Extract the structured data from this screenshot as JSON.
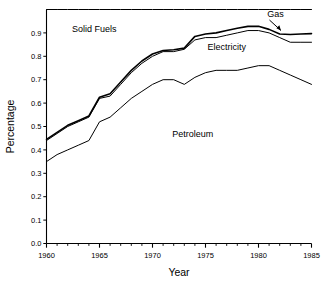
{
  "chart_data": {
    "type": "line",
    "title": "",
    "subtitle": "",
    "xlabel": "Year",
    "ylabel": "Percentage",
    "xlim": [
      1960,
      1985
    ],
    "ylim": [
      0.0,
      1.0
    ],
    "grid": false,
    "legend_position": "inline-annotations",
    "x_ticks_major": [
      1960,
      1965,
      1970,
      1975,
      1980,
      1985
    ],
    "x_tick_labels": [
      "1960",
      "1965",
      "1970",
      "1975",
      "1980",
      "1985"
    ],
    "x_ticks_minor_step": 1,
    "y_ticks": [
      0.0,
      0.1,
      0.2,
      0.3,
      0.4,
      0.5,
      0.6,
      0.7,
      0.8,
      0.9
    ],
    "y_tick_labels": [
      "0.0",
      "0.1",
      "0.2",
      "0.3",
      "0.4",
      "0.5",
      "0.6",
      "0.7",
      "0.8",
      "0.9"
    ],
    "x": [
      1960,
      1961,
      1962,
      1963,
      1964,
      1965,
      1966,
      1967,
      1968,
      1969,
      1970,
      1971,
      1972,
      1973,
      1974,
      1975,
      1976,
      1977,
      1978,
      1979,
      1980,
      1981,
      1982,
      1983,
      1984,
      1985
    ],
    "series": [
      {
        "name": "Petroleum",
        "label": "Petroleum",
        "color": "#000000",
        "line_width": 1,
        "values": [
          0.35,
          0.38,
          0.4,
          0.42,
          0.44,
          0.52,
          0.54,
          0.58,
          0.62,
          0.65,
          0.68,
          0.7,
          0.7,
          0.68,
          0.71,
          0.73,
          0.74,
          0.74,
          0.74,
          0.75,
          0.76,
          0.76,
          0.74,
          0.72,
          0.7,
          0.68
        ]
      },
      {
        "name": "Electricity",
        "label": "Electricity",
        "color": "#000000",
        "line_width": 1,
        "values": [
          0.44,
          0.47,
          0.5,
          0.52,
          0.54,
          0.62,
          0.63,
          0.68,
          0.73,
          0.77,
          0.8,
          0.82,
          0.82,
          0.83,
          0.87,
          0.88,
          0.88,
          0.89,
          0.9,
          0.91,
          0.91,
          0.9,
          0.88,
          0.86,
          0.86,
          0.86
        ]
      },
      {
        "name": "Gas",
        "label": "Gas",
        "color": "#000000",
        "line_width": 1.6,
        "values": [
          0.445,
          0.475,
          0.505,
          0.525,
          0.545,
          0.625,
          0.64,
          0.69,
          0.74,
          0.78,
          0.81,
          0.825,
          0.828,
          0.835,
          0.885,
          0.895,
          0.9,
          0.91,
          0.92,
          0.928,
          0.928,
          0.915,
          0.895,
          0.893,
          0.895,
          0.897
        ]
      },
      {
        "name": "Solid Fuels",
        "label": "Solid Fuels",
        "color": "#000000",
        "line_width": 1,
        "values": [
          1.0,
          1.0,
          1.0,
          1.0,
          1.0,
          1.0,
          1.0,
          1.0,
          1.0,
          1.0,
          1.0,
          1.0,
          1.0,
          1.0,
          1.0,
          1.0,
          1.0,
          1.0,
          1.0,
          1.0,
          1.0,
          1.0,
          1.0,
          1.0,
          1.0,
          1.0
        ]
      }
    ],
    "annotations": [
      {
        "name": "solid-fuels",
        "text": "Solid Fuels",
        "x": 1964.5,
        "y": 0.905
      },
      {
        "name": "electricity",
        "text": "Electricity",
        "x": 1977.0,
        "y": 0.825
      },
      {
        "name": "gas",
        "text": "Gas",
        "x": 1981.6,
        "y": 0.97,
        "has_arrow": true
      },
      {
        "name": "petroleum",
        "text": "Petroleum",
        "x": 1973.8,
        "y": 0.455
      }
    ]
  }
}
